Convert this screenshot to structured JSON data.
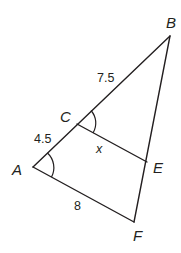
{
  "diagram": {
    "title": "",
    "vertices": {
      "A": {
        "label": "A",
        "x": 33,
        "y": 167
      },
      "B": {
        "label": "B",
        "x": 170,
        "y": 36
      },
      "C": {
        "label": "C",
        "x": 77,
        "y": 124
      },
      "E": {
        "label": "E",
        "x": 147,
        "y": 162
      },
      "F": {
        "label": "F",
        "x": 134,
        "y": 222
      }
    },
    "segments": [
      {
        "from": "A",
        "to": "B"
      },
      {
        "from": "B",
        "to": "F"
      },
      {
        "from": "A",
        "to": "F"
      },
      {
        "from": "C",
        "to": "E"
      }
    ],
    "measurements": {
      "AC": "4.5",
      "CB": "7.5",
      "AF": "8",
      "CE": "x"
    },
    "angle_marks": [
      {
        "vertex": "A",
        "between": [
          "C",
          "F"
        ],
        "type": "single-arc"
      },
      {
        "vertex": "C",
        "between": [
          "B",
          "E"
        ],
        "type": "single-arc"
      }
    ],
    "colors": {
      "stroke": "#231f20",
      "background": "#ffffff"
    }
  }
}
